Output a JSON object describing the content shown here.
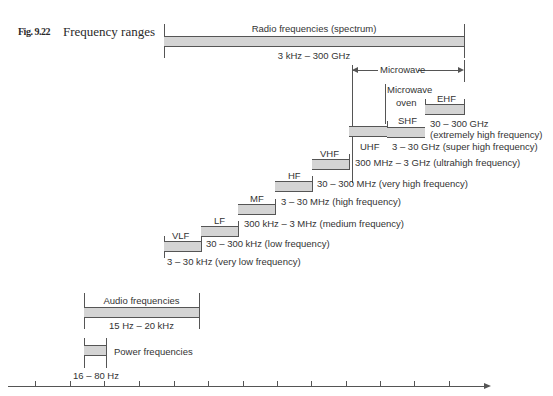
{
  "figure": {
    "number": "Fig. 9.22",
    "title": "Frequency ranges"
  },
  "radio": {
    "label": "Radio frequencies (spectrum)",
    "range": "3 kHz – 300 GHz"
  },
  "microwave": {
    "label": "Microwave",
    "oven_line1": "Microwave",
    "oven_line2": "oven"
  },
  "bands": [
    {
      "abbr": "VLF",
      "range": "3 – 30 kHz (very low frequency)"
    },
    {
      "abbr": "LF",
      "range": "30 – 300 kHz (low frequency)"
    },
    {
      "abbr": "MF",
      "range": "300 kHz – 3 MHz (medium frequency)"
    },
    {
      "abbr": "HF",
      "range": "3 – 30 MHz (high frequency)"
    },
    {
      "abbr": "VHF",
      "range": "30 – 300 MHz (very high frequency)"
    },
    {
      "abbr": "UHF",
      "range": "300 MHz – 3 GHz (ultrahigh frequency)"
    },
    {
      "abbr": "SHF",
      "range": "3 – 30 GHz (super high frequency)"
    },
    {
      "abbr": "EHF",
      "range_line1": "30 – 300 GHz",
      "range_line2": "(extremely high frequency)"
    }
  ],
  "audio": {
    "label": "Audio frequencies",
    "range": "15 Hz – 20 kHz"
  },
  "power": {
    "label": "Power frequencies",
    "range": "16 – 80 Hz"
  },
  "colors": {
    "bar_fill": "#d4d4d4",
    "line": "#555555"
  }
}
